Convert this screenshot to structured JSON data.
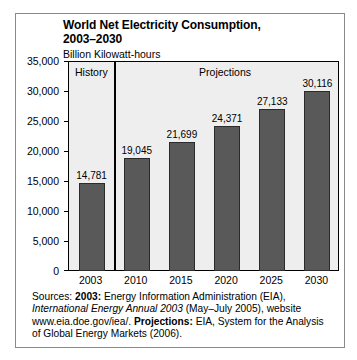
{
  "chart_data": {
    "type": "bar",
    "title": "World Net Electricity Consumption,\n2003–2030",
    "subtitle": "Billion Kilowatt-hours",
    "xlabel": "",
    "ylabel": "Billion Kilowatt-hours",
    "categories": [
      "2003",
      "2010",
      "2015",
      "2020",
      "2025",
      "2030"
    ],
    "values": [
      14781,
      21699,
      21699,
      24371,
      27133,
      30116
    ],
    "series": [
      {
        "name": "World Net Electricity Consumption",
        "values": [
          14781,
          19045,
          21699,
          24371,
          27133,
          30116
        ],
        "labels": [
          "14,781",
          "19,045",
          "21,699",
          "24,371",
          "27,133",
          "30,116"
        ]
      }
    ],
    "ylim": [
      0,
      35000
    ],
    "ytick_step": 5000,
    "yticks": [
      0,
      5000,
      10000,
      15000,
      20000,
      25000,
      30000,
      35000
    ],
    "ytick_labels": [
      "0",
      "5,000",
      "10,000",
      "15,000",
      "20,000",
      "25,000",
      "30,000",
      "35,000"
    ],
    "grid": false,
    "legend": "none",
    "bands": [
      {
        "label": "History",
        "from": "2003",
        "to": "2003"
      },
      {
        "label": "Projections",
        "from": "2010",
        "to": "2030"
      }
    ],
    "colors": {
      "bar_fill": "#595959",
      "bar_stroke": "#2b2b2b",
      "plot_background": "#eeeeee",
      "axis": "#000000",
      "frame": "#8a8a8a",
      "text": "#000000"
    }
  },
  "source_note": {
    "lead": "Sources: ",
    "label_2003": "2003:",
    "text_1": " Energy Information Administration (EIA), ",
    "italic_1": "International Energy Annual 2003",
    "text_2": " (May–July 2005), website www.eia.doe.gov/iea/. ",
    "label_projections": "Projections:",
    "text_3": " EIA, System for the Analysis of Global Energy Markets (2006)."
  }
}
